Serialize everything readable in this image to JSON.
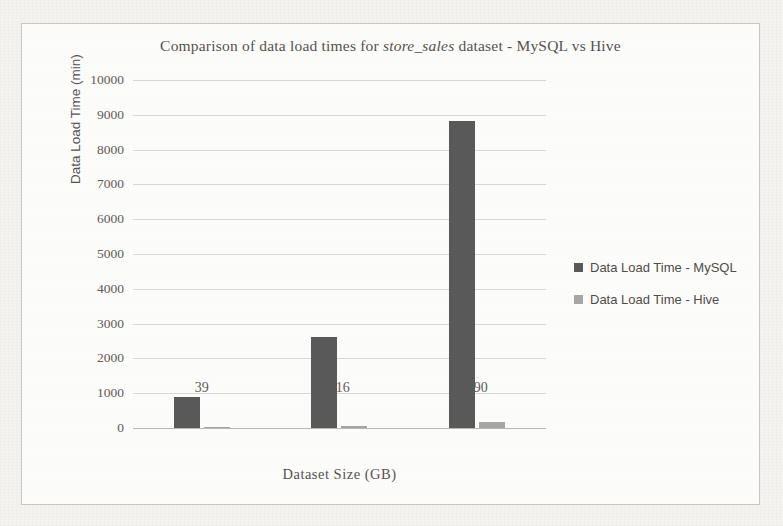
{
  "chart_data": {
    "type": "bar",
    "title": "Comparison of data load times for store_sales dataset - MySQL vs Hive",
    "title_parts": {
      "before": "Comparison of data load times for ",
      "italic": "store_sales",
      "after": " dataset - MySQL vs Hive"
    },
    "xlabel": "Dataset Size (GB)",
    "ylabel": "Data Load Time (min)",
    "categories": [
      "39",
      "116",
      "390"
    ],
    "series": [
      {
        "name": "Data Load Time - MySQL",
        "color": "#595959",
        "values": [
          890,
          2615,
          8820
        ]
      },
      {
        "name": "Data Load Time - Hive",
        "color": "#a6a6a6",
        "values": [
          30,
          60,
          170
        ]
      }
    ],
    "ylim": [
      0,
      10000
    ],
    "ytick_step": 1000,
    "yticks": [
      "10000",
      "9000",
      "8000",
      "7000",
      "6000",
      "5000",
      "4000",
      "3000",
      "2000",
      "1000",
      "0"
    ],
    "grid": true,
    "legend_position": "right"
  },
  "frame": {
    "border_color": "#c9c7c4",
    "background": "#f4f3f0"
  }
}
